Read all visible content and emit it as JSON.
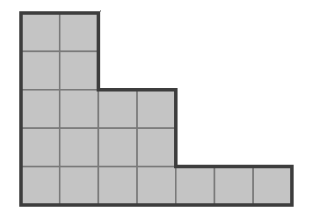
{
  "figure": {
    "type": "staircase-grid-shape",
    "rows": [
      {
        "row": 1,
        "cells": 2
      },
      {
        "row": 2,
        "cells": 2
      },
      {
        "row": 3,
        "cells": 4
      },
      {
        "row": 4,
        "cells": 4
      },
      {
        "row": 5,
        "cells": 7
      }
    ],
    "total_cells": 19,
    "colors": {
      "fill": "#c4c4c4",
      "grid_line": "#7a7a7a",
      "outline": "#3d3d3d",
      "background": "#ffffff"
    }
  }
}
